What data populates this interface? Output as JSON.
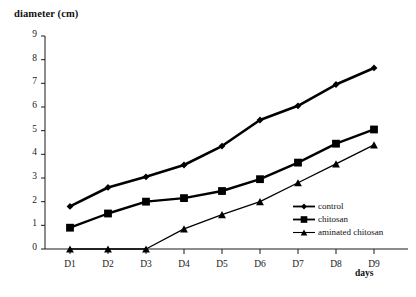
{
  "chart_data": {
    "type": "line",
    "title": "",
    "ylabel": "diameter (cm)",
    "xlabel": "days",
    "categories": [
      "D1",
      "D2",
      "D3",
      "D4",
      "D5",
      "D6",
      "D7",
      "D8",
      "D9"
    ],
    "ylim": [
      0,
      9
    ],
    "yticks": [
      0,
      1,
      2,
      3,
      4,
      5,
      6,
      7,
      8,
      9
    ],
    "grid": false,
    "legend_position": "inside-bottom-right",
    "series": [
      {
        "name": "control",
        "marker": "diamond",
        "color": "#000000",
        "values": [
          1.8,
          2.6,
          3.05,
          3.55,
          4.35,
          5.45,
          6.05,
          6.95,
          7.65
        ]
      },
      {
        "name": "chitosan",
        "marker": "square",
        "color": "#000000",
        "values": [
          0.9,
          1.5,
          2.0,
          2.15,
          2.45,
          2.95,
          3.65,
          4.45,
          5.05
        ]
      },
      {
        "name": "aminated chitosan",
        "marker": "triangle",
        "color": "#000000",
        "values": [
          0.0,
          0.0,
          0.0,
          0.85,
          1.45,
          2.0,
          2.8,
          3.6,
          4.4
        ]
      }
    ]
  },
  "axes": {
    "y_title": "diameter (cm)",
    "x_title": "days",
    "y_tick_labels": [
      "9",
      "8",
      "7",
      "6",
      "5",
      "4",
      "3",
      "2",
      "1",
      "0"
    ],
    "x_tick_labels": [
      "D1",
      "D2",
      "D3",
      "D4",
      "D5",
      "D6",
      "D7",
      "D8",
      "D9"
    ]
  },
  "legend": {
    "items": [
      {
        "label": "control",
        "marker": "diamond"
      },
      {
        "label": "chitosan",
        "marker": "square"
      },
      {
        "label": "aminated chitosan",
        "marker": "triangle"
      }
    ]
  },
  "style": {
    "line_color": "#000000",
    "axis_color": "#1a1a1a",
    "background": "#ffffff"
  }
}
